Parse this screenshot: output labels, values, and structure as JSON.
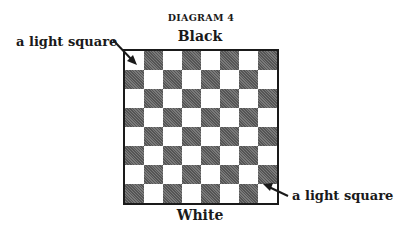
{
  "title": "DIAGRAM 4",
  "top_label": "Black",
  "bottom_label": "White",
  "callouts": [
    {
      "text": "a light square",
      "position": "top-left"
    },
    {
      "text": "a light square",
      "position": "bottom-right"
    }
  ],
  "board": {
    "rows": 8,
    "cols": 8,
    "top_left_square": "light",
    "colors": {
      "light": "#ffffff",
      "dark": "#6b6b6b",
      "border": "#1a1a1a"
    }
  }
}
